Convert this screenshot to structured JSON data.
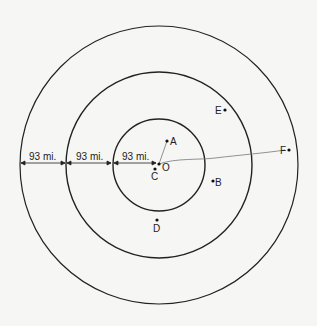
{
  "diagram": {
    "center": {
      "label": "O"
    },
    "rings": [
      {
        "name": "inner"
      },
      {
        "name": "middle"
      },
      {
        "name": "outer"
      }
    ],
    "distances": [
      {
        "label": "93 mi."
      },
      {
        "label": "93 mi."
      },
      {
        "label": "93 mi."
      }
    ],
    "points": [
      {
        "label": "A"
      },
      {
        "label": "B"
      },
      {
        "label": "C"
      },
      {
        "label": "D"
      },
      {
        "label": "E"
      },
      {
        "label": "F"
      }
    ]
  }
}
